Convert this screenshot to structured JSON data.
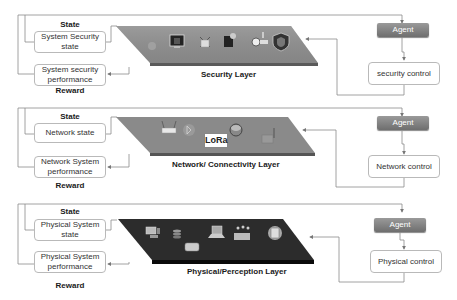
{
  "layers": [
    {
      "id": "security",
      "title": "Security Layer",
      "state_label": "State",
      "state_box": "System Security state",
      "state_box_lines": [
        "System Security",
        "state"
      ],
      "reward_box_lines": [
        "System security",
        "performance"
      ],
      "reward_label": "Reward",
      "agent_label": "Agent",
      "control_label": "security  control",
      "plane_color": "#8a8a8a",
      "icons": [
        "bug-icon",
        "monitor-lock-icon",
        "broken-lock-icon",
        "document-icon",
        "key-icon",
        "shield-icon"
      ]
    },
    {
      "id": "network",
      "title": "Network/ Connectivity Layer",
      "state_label": "State",
      "state_box_lines": [
        "Network state"
      ],
      "reward_box_lines": [
        "Network System",
        "performance"
      ],
      "reward_label": "Reward",
      "agent_label": "Agent",
      "control_label": "Network control",
      "lora_label": "LoRa",
      "plane_color": "#888888",
      "icons": [
        "router-icon",
        "bluetooth-icon",
        "lora-icon",
        "network-hub-icon",
        "antenna-icon"
      ]
    },
    {
      "id": "physical",
      "title": "Physical/Perception Layer",
      "state_label": "State",
      "state_box_lines": [
        "Physical System",
        "state"
      ],
      "reward_box_lines": [
        "Physical System",
        "performance"
      ],
      "reward_label": "Reward",
      "agent_label": "Agent",
      "control_label": "Physical  control",
      "plane_color": "#2a2a2a",
      "icons": [
        "workstation-icon",
        "database-icon",
        "truck-icon",
        "laptop-icon",
        "factory-icon",
        "smartphone-icon"
      ]
    }
  ]
}
